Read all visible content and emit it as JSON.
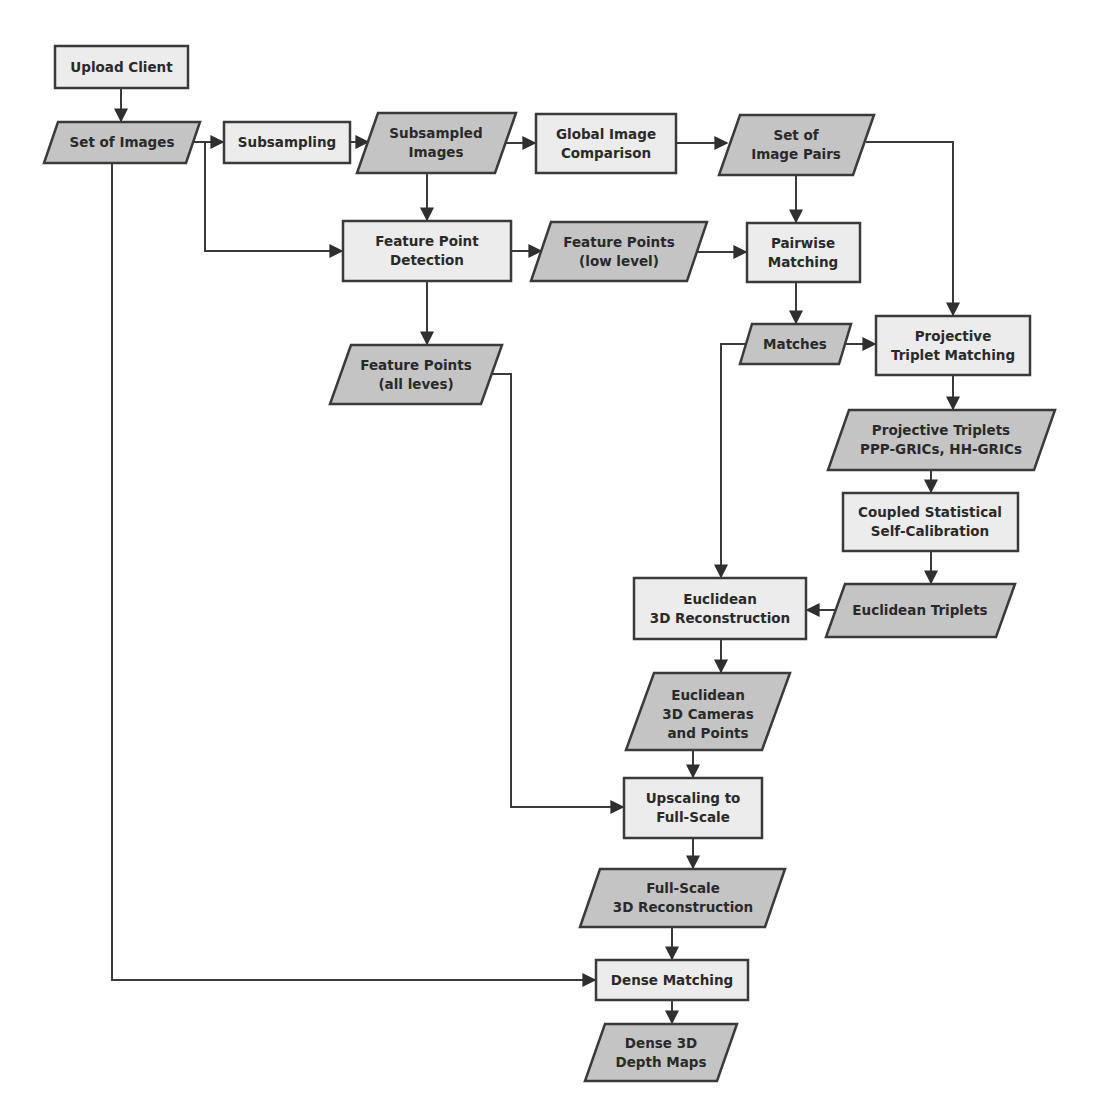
{
  "diagram": {
    "type": "flowchart",
    "colors": {
      "process_fill": "#ececec",
      "data_fill": "#c4c4c4",
      "stroke": "#3a3a3a",
      "text": "#2a2a2a"
    },
    "nodes": {
      "upload_client": {
        "shape": "process",
        "lines": [
          "Upload Client"
        ]
      },
      "set_of_images": {
        "shape": "data",
        "lines": [
          "Set of Images"
        ]
      },
      "subsampling": {
        "shape": "process",
        "lines": [
          "Subsampling"
        ]
      },
      "subsampled_images": {
        "shape": "data",
        "lines": [
          "Subsampled",
          "Images"
        ]
      },
      "global_image_comparison": {
        "shape": "process",
        "lines": [
          "Global Image",
          "Comparison"
        ]
      },
      "set_of_image_pairs": {
        "shape": "data",
        "lines": [
          "Set of",
          "Image Pairs"
        ]
      },
      "feature_point_detection": {
        "shape": "process",
        "lines": [
          "Feature Point",
          "Detection"
        ]
      },
      "feature_points_low": {
        "shape": "data",
        "lines": [
          "Feature Points",
          "(low level)"
        ]
      },
      "pairwise_matching": {
        "shape": "process",
        "lines": [
          "Pairwise",
          "Matching"
        ]
      },
      "feature_points_all": {
        "shape": "data",
        "lines": [
          "Feature Points",
          "(all leves)"
        ]
      },
      "matches": {
        "shape": "data",
        "lines": [
          "Matches"
        ]
      },
      "projective_triplet_matching": {
        "shape": "process",
        "lines": [
          "Projective",
          "Triplet Matching"
        ]
      },
      "projective_triplets": {
        "shape": "data",
        "lines": [
          "Projective Triplets",
          "PPP-GRICs, HH-GRICs"
        ]
      },
      "coupled_self_calibration": {
        "shape": "process",
        "lines": [
          "Coupled Statistical",
          "Self-Calibration"
        ]
      },
      "euclidean_triplets": {
        "shape": "data",
        "lines": [
          "Euclidean Triplets"
        ]
      },
      "euclidean_3d_reconstruction": {
        "shape": "process",
        "lines": [
          "Euclidean",
          "3D Reconstruction"
        ]
      },
      "euclidean_3d_cameras": {
        "shape": "data",
        "lines": [
          "Euclidean",
          "3D Cameras",
          "and Points"
        ]
      },
      "upscaling": {
        "shape": "process",
        "lines": [
          "Upscaling to",
          "Full-Scale"
        ]
      },
      "full_scale_reconstruction": {
        "shape": "data",
        "lines": [
          "Full-Scale",
          "3D Reconstruction"
        ]
      },
      "dense_matching": {
        "shape": "process",
        "lines": [
          "Dense Matching"
        ]
      },
      "dense_depth_maps": {
        "shape": "data",
        "lines": [
          "Dense 3D",
          "Depth Maps"
        ]
      }
    },
    "edges": [
      [
        "Upload Client",
        "Set of Images"
      ],
      [
        "Set of Images",
        "Subsampling"
      ],
      [
        "Set of Images",
        "Feature Point Detection"
      ],
      [
        "Set of Images",
        "Dense Matching"
      ],
      [
        "Subsampling",
        "Subsampled Images"
      ],
      [
        "Subsampled Images",
        "Global Image Comparison"
      ],
      [
        "Subsampled Images",
        "Feature Point Detection"
      ],
      [
        "Global Image Comparison",
        "Set of Image Pairs"
      ],
      [
        "Set of Image Pairs",
        "Pairwise Matching"
      ],
      [
        "Set of Image Pairs",
        "Projective Triplet Matching"
      ],
      [
        "Feature Point Detection",
        "Feature Points (low level)"
      ],
      [
        "Feature Point Detection",
        "Feature Points (all leves)"
      ],
      [
        "Feature Points (low level)",
        "Pairwise Matching"
      ],
      [
        "Pairwise Matching",
        "Matches"
      ],
      [
        "Matches",
        "Projective Triplet Matching"
      ],
      [
        "Matches",
        "Euclidean 3D Reconstruction"
      ],
      [
        "Projective Triplet Matching",
        "Projective Triplets PPP-GRICs, HH-GRICs"
      ],
      [
        "Projective Triplets PPP-GRICs, HH-GRICs",
        "Coupled Statistical Self-Calibration"
      ],
      [
        "Coupled Statistical Self-Calibration",
        "Euclidean Triplets"
      ],
      [
        "Euclidean Triplets",
        "Euclidean 3D Reconstruction"
      ],
      [
        "Euclidean 3D Reconstruction",
        "Euclidean 3D Cameras and Points"
      ],
      [
        "Euclidean 3D Cameras and Points",
        "Upscaling to Full-Scale"
      ],
      [
        "Feature Points (all leves)",
        "Upscaling to Full-Scale"
      ],
      [
        "Upscaling to Full-Scale",
        "Full-Scale 3D Reconstruction"
      ],
      [
        "Full-Scale 3D Reconstruction",
        "Dense Matching"
      ],
      [
        "Dense Matching",
        "Dense 3D Depth Maps"
      ]
    ]
  }
}
